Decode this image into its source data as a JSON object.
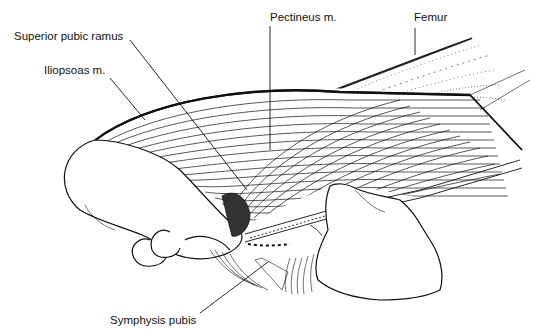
{
  "figure": {
    "labels": {
      "superior_pubic_ramus": "Superior pubic ramus",
      "iliopsoas": "Iliopsoas m.",
      "pectineus": "Pectineus m.",
      "femur": "Femur",
      "symphysis_pubis": "Symphysis pubis"
    },
    "colors": {
      "ink": "#111111",
      "background": "#ffffff"
    }
  }
}
